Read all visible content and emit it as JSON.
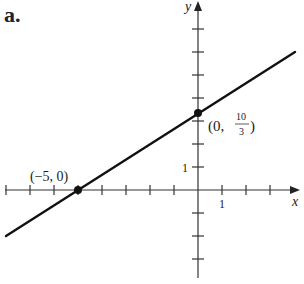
{
  "figure": {
    "panel_label": "a.",
    "x_axis_label": "x",
    "y_axis_label": "y",
    "x_tick_label": "1",
    "y_tick_label": "1",
    "point_a_label": "(−5, 0)",
    "point_b_label_prefix": "(0, ",
    "point_b_frac_num": "10",
    "point_b_frac_den": "3",
    "point_b_label_suffix": ")"
  },
  "chart_data": {
    "type": "line",
    "title": "a.",
    "xlabel": "x",
    "ylabel": "y",
    "xlim": [
      -8,
      4
    ],
    "ylim": [
      -3,
      7
    ],
    "grid": false,
    "legend": null,
    "x_ticks": [
      -8,
      -7,
      -6,
      -5,
      -4,
      -3,
      -2,
      -1,
      1,
      2,
      3
    ],
    "y_ticks": [
      -3,
      -2,
      -1,
      1,
      2,
      3,
      4,
      5,
      6,
      7
    ],
    "tick_labels": {
      "x": [
        "1"
      ],
      "y": [
        "1"
      ]
    },
    "series": [
      {
        "name": "line through (-5,0) and (0,10/3)",
        "slope": 0.6667,
        "intercept": 3.3333,
        "x": [
          -8,
          4
        ],
        "y": [
          -2,
          6
        ]
      }
    ],
    "points": [
      {
        "x": -5,
        "y": 0,
        "label": "(−5, 0)"
      },
      {
        "x": 0,
        "y": 3.3333,
        "label": "(0, 10/3)"
      }
    ]
  }
}
